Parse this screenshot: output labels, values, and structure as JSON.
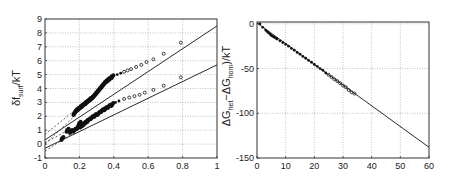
{
  "chart_data": [
    {
      "type": "scatter",
      "panel": "left",
      "title": "",
      "xlabel": "",
      "ylabel": "δf_surf/kT",
      "ylabel_main": "δf",
      "ylabel_sub": "surf",
      "ylabel_tail": "/kT",
      "xlim": [
        0,
        1
      ],
      "ylim": [
        -1,
        9
      ],
      "xticks": [
        0,
        0.2,
        0.4,
        0.6,
        0.8,
        1
      ],
      "xtick_labels": [
        "0",
        "0.2",
        "0.4",
        "0.6",
        "0.8",
        "1"
      ],
      "yticks": [
        -1,
        0,
        1,
        2,
        3,
        4,
        5,
        6,
        7,
        8,
        9
      ],
      "ytick_labels": [
        "-1",
        "0",
        "1",
        "2",
        "3",
        "4",
        "5",
        "6",
        "7",
        "8",
        "9"
      ],
      "grid": true,
      "legend": null,
      "series": [
        {
          "name": "upper data",
          "marker": "dot",
          "x": [
            0.17,
            0.18,
            0.19,
            0.2,
            0.21,
            0.22,
            0.23,
            0.24,
            0.25,
            0.26,
            0.27,
            0.28,
            0.29,
            0.3,
            0.31,
            0.32,
            0.33,
            0.34,
            0.35,
            0.36,
            0.37,
            0.38,
            0.39,
            0.4,
            0.42,
            0.44,
            0.46,
            0.48,
            0.5,
            0.53,
            0.56,
            0.59,
            0.63,
            0.69,
            0.79
          ],
          "y": [
            2.2,
            2.4,
            2.5,
            2.6,
            2.7,
            2.8,
            2.9,
            3.0,
            3.1,
            3.2,
            3.3,
            3.4,
            3.55,
            3.7,
            3.85,
            4.0,
            4.15,
            4.3,
            4.45,
            4.55,
            4.65,
            4.75,
            4.85,
            4.9,
            5.0,
            5.1,
            5.2,
            5.3,
            5.4,
            5.55,
            5.7,
            5.9,
            6.1,
            6.5,
            7.3
          ]
        },
        {
          "name": "lower data",
          "marker": "dot",
          "x": [
            0.1,
            0.13,
            0.15,
            0.17,
            0.19,
            0.2,
            0.21,
            0.22,
            0.23,
            0.24,
            0.25,
            0.27,
            0.29,
            0.31,
            0.33,
            0.35,
            0.37,
            0.39,
            0.41,
            0.43,
            0.46,
            0.49,
            0.52,
            0.55,
            0.58,
            0.63,
            0.69,
            0.79
          ],
          "y": [
            0.4,
            1.0,
            0.9,
            1.0,
            1.2,
            1.5,
            1.3,
            1.4,
            1.5,
            1.6,
            1.7,
            1.9,
            2.05,
            2.2,
            2.4,
            2.55,
            2.7,
            2.85,
            3.0,
            3.1,
            3.25,
            3.35,
            3.45,
            3.55,
            3.7,
            3.9,
            4.2,
            4.8
          ]
        },
        {
          "name": "upper fit",
          "style": "solid",
          "x": [
            0,
            1
          ],
          "y": [
            0.3,
            8.5
          ]
        },
        {
          "name": "lower fit",
          "style": "solid",
          "x": [
            0,
            1
          ],
          "y": [
            -0.3,
            5.7
          ]
        },
        {
          "name": "upper bound dashed 1",
          "style": "dashed",
          "x": [
            0,
            0.17
          ],
          "y": [
            0.7,
            2.4
          ]
        },
        {
          "name": "upper bound dashed 2",
          "style": "dashed",
          "x": [
            0,
            0.17
          ],
          "y": [
            0.0,
            2.0
          ]
        },
        {
          "name": "lower bound dashed 1",
          "style": "dashed",
          "x": [
            0,
            0.15
          ],
          "y": [
            0.1,
            1.1
          ]
        },
        {
          "name": "lower bound dashed 2",
          "style": "dashed",
          "x": [
            0,
            0.15
          ],
          "y": [
            -0.5,
            0.7
          ]
        }
      ]
    },
    {
      "type": "scatter",
      "panel": "right",
      "title": "",
      "xlabel": "",
      "ylabel": "ΔG_het−ΔG_hom)/kT",
      "ylabel_parts": [
        "ΔG",
        "het",
        "−ΔG",
        "hom",
        ")/kT"
      ],
      "xlim": [
        0,
        60
      ],
      "ylim": [
        -150,
        2
      ],
      "xticks": [
        0,
        10,
        20,
        30,
        40,
        50,
        60
      ],
      "xtick_labels": [
        "0",
        "10",
        "20",
        "30",
        "40",
        "50",
        "60"
      ],
      "yticks": [
        0,
        -50,
        -100,
        -150
      ],
      "ytick_labels": [
        "0",
        "-50",
        "-100",
        "-150"
      ],
      "grid": true,
      "legend": null,
      "series": [
        {
          "name": "data",
          "marker": "dot",
          "x": [
            1,
            2,
            3,
            3.5,
            4,
            4.5,
            5,
            5.5,
            6,
            6.5,
            7,
            8,
            9,
            10,
            11,
            12,
            13,
            14,
            15,
            16,
            17,
            18,
            19,
            20,
            21,
            22,
            23,
            24,
            25,
            26,
            27,
            28,
            29,
            30,
            31,
            32,
            33,
            34
          ],
          "y": [
            0,
            -4,
            -7,
            -8.5,
            -10,
            -11.5,
            -13,
            -14,
            -15,
            -16,
            -17,
            -19,
            -21,
            -23,
            -25,
            -27.5,
            -29.5,
            -32,
            -34,
            -36.5,
            -38.5,
            -41,
            -43,
            -45.5,
            -47.5,
            -50,
            -52,
            -55,
            -57,
            -59.5,
            -62,
            -64,
            -66.5,
            -69,
            -71,
            -74,
            -76.5,
            -78
          ]
        },
        {
          "name": "fit",
          "style": "solid",
          "x": [
            0,
            60
          ],
          "y": [
            1,
            -138
          ]
        }
      ]
    }
  ],
  "colors": {
    "background": "#ffffff",
    "frame": "#333333",
    "grid": "#999999",
    "ink": "#111111"
  }
}
